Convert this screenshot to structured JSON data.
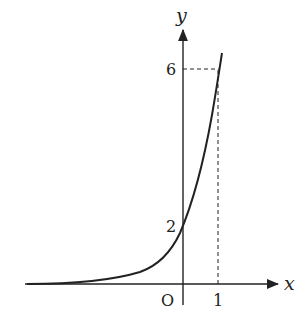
{
  "diagram": {
    "type": "function-graph",
    "axes": {
      "x_label": "x",
      "y_label": "y",
      "origin_label": "O"
    },
    "ticks": {
      "x": [
        {
          "value": 1,
          "label": "1"
        }
      ],
      "y": [
        {
          "value": 2,
          "label": "2"
        },
        {
          "value": 6,
          "label": "6"
        }
      ]
    },
    "curve": {
      "kind": "exponential",
      "description": "increasing curve through (0,2) and (1,6), approaching y=0 as x decreases",
      "points": [
        [
          0,
          2
        ],
        [
          1,
          6
        ]
      ]
    },
    "guides": [
      {
        "kind": "dashed",
        "from": [
          0,
          6
        ],
        "to": [
          1,
          6
        ]
      },
      {
        "kind": "dashed",
        "from": [
          1,
          0
        ],
        "to": [
          1,
          6
        ]
      }
    ],
    "colors": {
      "stroke": "#222222",
      "background": "#ffffff"
    }
  }
}
